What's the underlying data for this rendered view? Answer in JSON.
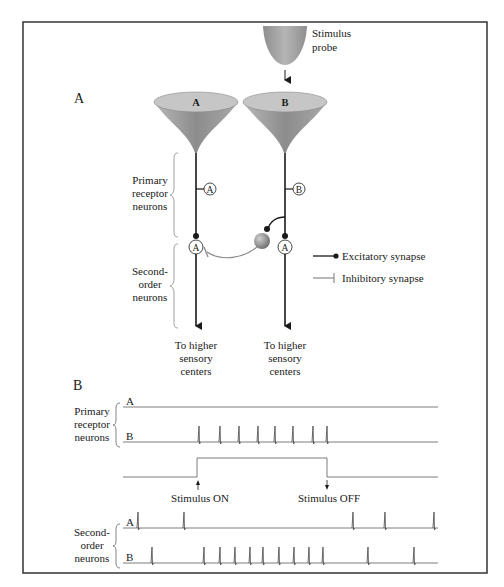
{
  "panel_a": {
    "label": "A",
    "stimulus_probe": {
      "line1": "Stimulus",
      "line2": "probe"
    },
    "receptors": [
      {
        "id": "A",
        "cone_label": "A",
        "circle_label": "A",
        "second_order_label": "A"
      },
      {
        "id": "B",
        "cone_label": "B",
        "circle_label": "B",
        "second_order_label": "A"
      }
    ],
    "groups": {
      "primary": {
        "line1": "Primary",
        "line2": "receptor",
        "line3": "neurons"
      },
      "second": {
        "line1": "Second-",
        "line2": "order",
        "line3": "neurons"
      }
    },
    "outputs": {
      "line1": "To higher",
      "line2": "sensory",
      "line3": "centers"
    },
    "legend": {
      "excitatory": "Excitatory synapse",
      "inhibitory": "Inhibitory synapse"
    }
  },
  "panel_b": {
    "label": "B",
    "primary_group": {
      "line1": "Primary",
      "line2": "receptor",
      "line3": "neurons"
    },
    "second_group": {
      "line1": "Second-",
      "line2": "order",
      "line3": "neurons"
    },
    "trace_labels": {
      "a": "A",
      "b": "B"
    },
    "stimulus_on": "Stimulus ON",
    "stimulus_off": "Stimulus OFF"
  },
  "colors": {
    "line": "#1a1a1a",
    "gray_line": "#8a8a8a",
    "cone_fill": "#9c9c9c",
    "cone_top": "#c4c4c4",
    "border": "#333333"
  },
  "chart_data": {
    "type": "spike-raster",
    "x_range": [
      123,
      438
    ],
    "stimulus": {
      "on_x": 198,
      "off_x": 327
    },
    "traces": [
      {
        "group": "Primary receptor neurons",
        "name": "A",
        "spikes": []
      },
      {
        "group": "Primary receptor neurons",
        "name": "B",
        "spikes": [
          199,
          220,
          239,
          258,
          275,
          293,
          313,
          327
        ]
      },
      {
        "group": "Second-order neurons",
        "name": "A",
        "spikes": [
          138,
          184,
          353,
          385,
          434
        ]
      },
      {
        "group": "Second-order neurons",
        "name": "B",
        "spikes": [
          152,
          204,
          220,
          235,
          250,
          263,
          279,
          294,
          309,
          323,
          368,
          414
        ]
      }
    ]
  }
}
